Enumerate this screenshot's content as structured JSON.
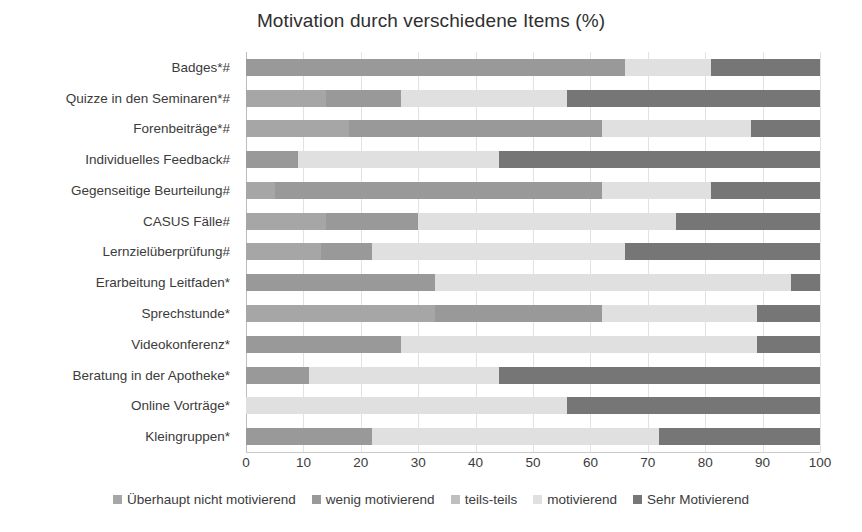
{
  "chart_data": {
    "type": "bar",
    "subtype": "stacked-horizontal-bar-100",
    "title": "Motivation durch verschiedene Items (%)",
    "xlabel": "",
    "ylabel": "",
    "xlim": [
      0,
      100
    ],
    "xticks": [
      0,
      10,
      20,
      30,
      40,
      50,
      60,
      70,
      80,
      90,
      100
    ],
    "grid": true,
    "legend_position": "bottom",
    "categories": [
      "Badges*#",
      "Quizze in den Seminaren*#",
      "Forenbeiträge*#",
      "Individuelles Feedback#",
      "Gegenseitige Beurteilung#",
      "CASUS Fälle#",
      "Lernzielüberprüfung#",
      "Erarbeitung Leitfaden*",
      "Sprechstunde*",
      "Videokonferenz*",
      "Beratung in der Apotheke*",
      "Online Vorträge*",
      "Kleingruppen*"
    ],
    "series": [
      {
        "name": "Überhaupt nicht motivierend",
        "color": "#a6a6a6",
        "values": [
          0,
          14,
          18,
          0,
          5,
          14,
          13,
          0,
          33,
          0,
          0,
          0,
          0
        ]
      },
      {
        "name": "wenig motivierend",
        "color": "#999999",
        "values": [
          66,
          13,
          44,
          9,
          57,
          16,
          9,
          33,
          29,
          27,
          11,
          0,
          22
        ]
      },
      {
        "name": "teils-teils",
        "color": "#bfbfbf",
        "values": [
          0,
          0,
          0,
          0,
          0,
          0,
          0,
          0,
          0,
          0,
          0,
          0,
          0
        ]
      },
      {
        "name": "motivierend",
        "color": "#e0e0e0",
        "values": [
          15,
          29,
          26,
          35,
          19,
          45,
          44,
          62,
          27,
          62,
          33,
          56,
          50
        ]
      },
      {
        "name": "Sehr Motivierend",
        "color": "#767676",
        "values": [
          19,
          44,
          12,
          56,
          19,
          25,
          34,
          5,
          11,
          11,
          56,
          44,
          28
        ]
      }
    ]
  },
  "legend": {
    "items": [
      {
        "label": "Überhaupt nicht motivierend",
        "color": "#a6a6a6"
      },
      {
        "label": "wenig motivierend",
        "color": "#999999"
      },
      {
        "label": "teils-teils",
        "color": "#bfbfbf"
      },
      {
        "label": "motivierend",
        "color": "#e0e0e0"
      },
      {
        "label": "Sehr Motivierend",
        "color": "#767676"
      }
    ]
  },
  "colors": {
    "background": "#ffffff",
    "text": "#3b3b3b",
    "gridline": "#e2e2e2",
    "axis": "#c9c9c9"
  }
}
